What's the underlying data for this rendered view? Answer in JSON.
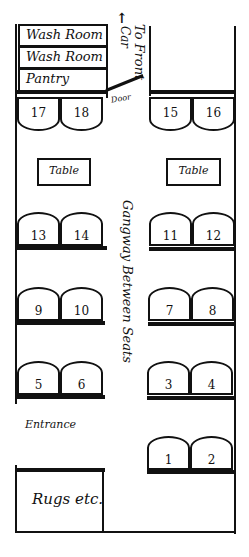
{
  "diagram": {
    "type": "railway-car-floor-plan",
    "rooms": [
      {
        "id": "washroom-1",
        "label": "Wash Room"
      },
      {
        "id": "washroom-2",
        "label": "Wash Room"
      },
      {
        "id": "pantry",
        "label": "Pantry"
      },
      {
        "id": "rugs",
        "label": "Rugs etc."
      }
    ],
    "labels": {
      "to_front_car": "To Front Car",
      "to_front": "To Front",
      "car": "Car",
      "arrow": "↑",
      "door": "Door",
      "gangway": "Gangway Between Seats",
      "entrance": "Entrance"
    },
    "tables": [
      {
        "side": "left",
        "label": "Table"
      },
      {
        "side": "right",
        "label": "Table"
      }
    ],
    "seats": {
      "left": [
        {
          "row": 1,
          "numbers": [
            "17",
            "18"
          ],
          "facing": "front"
        },
        {
          "row": 2,
          "numbers": [
            "13",
            "14"
          ],
          "facing": "back"
        },
        {
          "row": 3,
          "numbers": [
            "9",
            "10"
          ],
          "facing": "back"
        },
        {
          "row": 4,
          "numbers": [
            "5",
            "6"
          ],
          "facing": "back"
        }
      ],
      "right": [
        {
          "row": 1,
          "numbers": [
            "15",
            "16"
          ],
          "facing": "front"
        },
        {
          "row": 2,
          "numbers": [
            "11",
            "12"
          ],
          "facing": "back"
        },
        {
          "row": 3,
          "numbers": [
            "7",
            "8"
          ],
          "facing": "back"
        },
        {
          "row": 4,
          "numbers": [
            "3",
            "4"
          ],
          "facing": "back"
        },
        {
          "row": 5,
          "numbers": [
            "1",
            "2"
          ],
          "facing": "back"
        }
      ]
    }
  }
}
